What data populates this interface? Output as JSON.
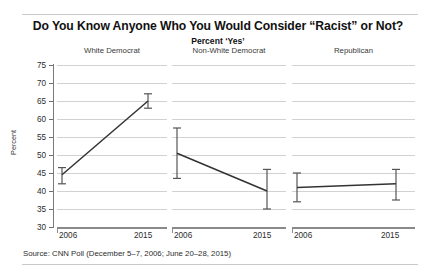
{
  "chart_data": {
    "type": "line",
    "title": "Do You Know Anyone Who You Would Consider “Racist” or Not?",
    "subtitle": "Percent ‘Yes’",
    "ylabel": "Percent",
    "xlabel": "",
    "ylim": [
      30,
      75
    ],
    "yticks": [
      30,
      35,
      40,
      45,
      50,
      55,
      60,
      65,
      70,
      75
    ],
    "grid": true,
    "legend": "none",
    "x": [
      "2006",
      "2015"
    ],
    "panels": [
      {
        "name": "White Democrat",
        "values": [
          44.5,
          65.0
        ],
        "ci_low": [
          42.0,
          63.0
        ],
        "ci_high": [
          46.5,
          67.0
        ]
      },
      {
        "name": "Non-White Democrat",
        "values": [
          50.5,
          40.0
        ],
        "ci_low": [
          43.5,
          35.0
        ],
        "ci_high": [
          57.5,
          46.0
        ]
      },
      {
        "name": "Republican",
        "values": [
          41.0,
          42.0
        ],
        "ci_low": [
          37.0,
          37.5
        ],
        "ci_high": [
          45.0,
          46.0
        ]
      }
    ],
    "source": "Source: CNN Poll (December 5–7, 2006; June 20–28, 2015)"
  },
  "colors": {
    "line": "#333333",
    "error_bar": "#555555",
    "grid": "#d2d2d2",
    "axis": "#8a8a8a",
    "text": "#1b1b1b",
    "background": "#ffffff"
  }
}
